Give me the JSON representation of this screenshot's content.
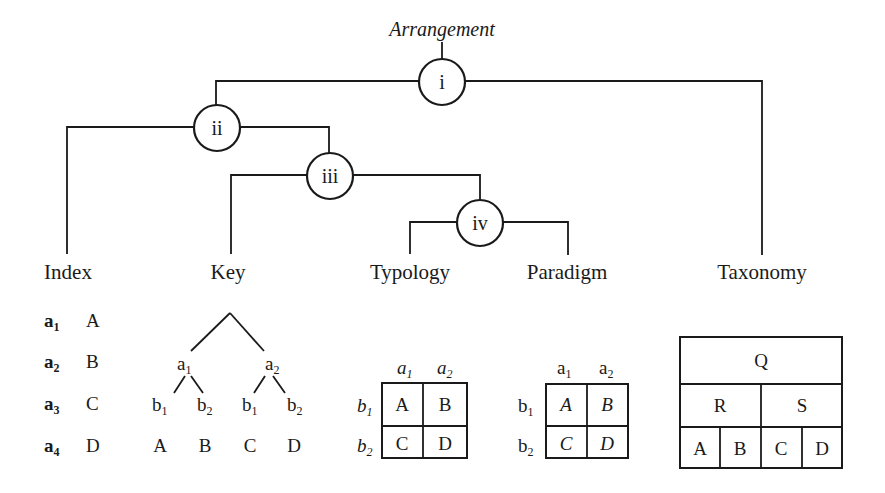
{
  "title": "Arrangement",
  "nodes": [
    {
      "id": "i",
      "label": "i"
    },
    {
      "id": "ii",
      "label": "ii"
    },
    {
      "id": "iii",
      "label": "iii"
    },
    {
      "id": "iv",
      "label": "iv"
    }
  ],
  "leaves": [
    {
      "id": "index",
      "label": "Index"
    },
    {
      "id": "key",
      "label": "Key"
    },
    {
      "id": "typology",
      "label": "Typology"
    },
    {
      "id": "paradigm",
      "label": "Paradigm"
    },
    {
      "id": "taxonomy",
      "label": "Taxonomy"
    }
  ],
  "tree_structure": {
    "i": [
      "ii",
      "taxonomy"
    ],
    "ii": [
      "index",
      "iii"
    ],
    "iii": [
      "key",
      "iv"
    ],
    "iv": [
      "typology",
      "paradigm"
    ]
  },
  "index": {
    "rows": [
      {
        "var": "a",
        "sub": "1",
        "value": "A"
      },
      {
        "var": "a",
        "sub": "2",
        "value": "B"
      },
      {
        "var": "a",
        "sub": "3",
        "value": "C"
      },
      {
        "var": "a",
        "sub": "4",
        "value": "D"
      }
    ]
  },
  "key": {
    "level1": [
      {
        "var": "a",
        "sub": "1"
      },
      {
        "var": "a",
        "sub": "2"
      }
    ],
    "level2": [
      {
        "var": "b",
        "sub": "1"
      },
      {
        "var": "b",
        "sub": "2"
      },
      {
        "var": "b",
        "sub": "1"
      },
      {
        "var": "b",
        "sub": "2"
      }
    ],
    "leaves": [
      "A",
      "B",
      "C",
      "D"
    ]
  },
  "typology": {
    "columns": [
      {
        "var": "a",
        "sub": "1"
      },
      {
        "var": "a",
        "sub": "2"
      }
    ],
    "rows": [
      {
        "var": "b",
        "sub": "1"
      },
      {
        "var": "b",
        "sub": "2"
      }
    ],
    "cells": [
      [
        "A",
        "B"
      ],
      [
        "C",
        "D"
      ]
    ]
  },
  "paradigm": {
    "columns": [
      {
        "var": "a",
        "sub": "1"
      },
      {
        "var": "a",
        "sub": "2"
      }
    ],
    "rows": [
      {
        "var": "b",
        "sub": "1"
      },
      {
        "var": "b",
        "sub": "2"
      }
    ],
    "cells": [
      [
        "A",
        "B"
      ],
      [
        "C",
        "D"
      ]
    ]
  },
  "taxonomy": {
    "root": "Q",
    "level1": [
      "R",
      "S"
    ],
    "leaves": [
      "A",
      "B",
      "C",
      "D"
    ]
  }
}
